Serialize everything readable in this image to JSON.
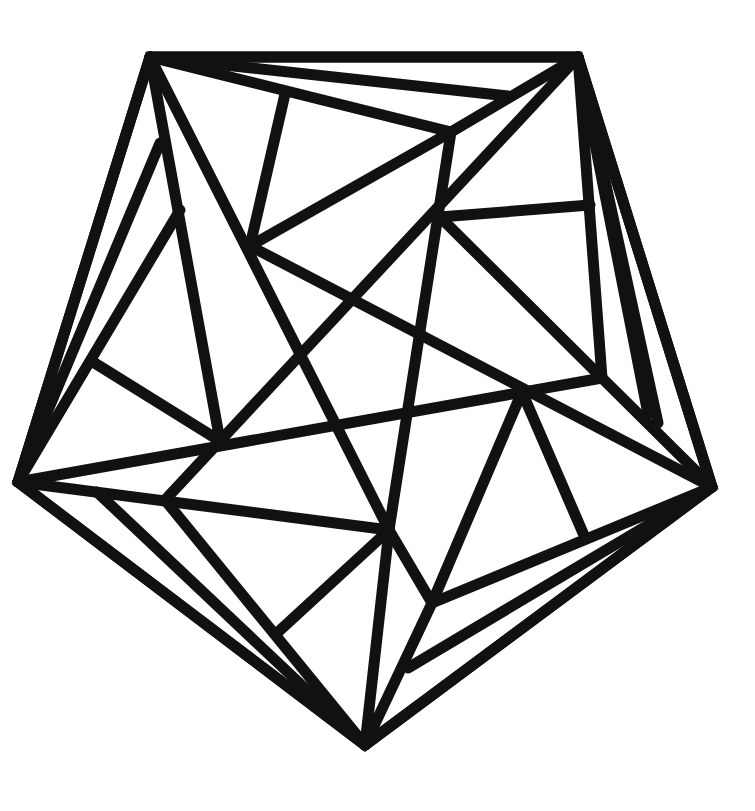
{
  "diagram": {
    "type": "geometric-line-art",
    "colors": {
      "background": "#ffffff",
      "stroke": "#111111"
    },
    "stroke_width": 11,
    "outline": {
      "shape": "pentagon",
      "vertices": [
        [
          150,
          57
        ],
        [
          578,
          57
        ],
        [
          712,
          487
        ],
        [
          365,
          745
        ],
        [
          18,
          482
        ]
      ]
    },
    "points": {
      "TL": [
        150,
        57
      ],
      "TR": [
        578,
        57
      ],
      "R": [
        712,
        487
      ],
      "BOT": [
        365,
        745
      ],
      "L": [
        18,
        482
      ],
      "A": [
        180,
        210
      ],
      "B": [
        250,
        246
      ],
      "C": [
        285,
        94
      ],
      "D": [
        451,
        132
      ],
      "E": [
        440,
        217
      ],
      "F": [
        93,
        362
      ],
      "G": [
        220,
        441
      ],
      "H": [
        165,
        500
      ],
      "I": [
        97,
        492
      ],
      "J": [
        389,
        530
      ],
      "K": [
        277,
        633
      ],
      "LP": [
        432,
        603
      ],
      "M": [
        522,
        392
      ],
      "N": [
        583,
        533
      ],
      "P": [
        408,
        668
      ],
      "Q": [
        602,
        378
      ],
      "S": [
        160,
        143
      ],
      "U": [
        508,
        96
      ],
      "V": [
        590,
        205
      ],
      "W1": [
        648,
        414
      ],
      "W2": [
        658,
        423
      ]
    },
    "segments": [
      [
        "TL",
        "TR"
      ],
      [
        "TR",
        "R"
      ],
      [
        "R",
        "BOT"
      ],
      [
        "BOT",
        "L"
      ],
      [
        "L",
        "TL"
      ],
      [
        "TL",
        "D"
      ],
      [
        "TL",
        "U"
      ],
      [
        "TR",
        "D"
      ],
      [
        "D",
        "B"
      ],
      [
        "C",
        "B"
      ],
      [
        "TL",
        "J"
      ],
      [
        "TL",
        "G"
      ],
      [
        "S",
        "L"
      ],
      [
        "A",
        "L"
      ],
      [
        "F",
        "G"
      ],
      [
        "TR",
        "G"
      ],
      [
        "D",
        "J"
      ],
      [
        "E",
        "V"
      ],
      [
        "TR",
        "Q"
      ],
      [
        "E",
        "Q"
      ],
      [
        "Q",
        "R"
      ],
      [
        "TR",
        "W1"
      ],
      [
        "TR",
        "W2"
      ],
      [
        "B",
        "R"
      ],
      [
        "L",
        "Q"
      ],
      [
        "L",
        "J"
      ],
      [
        "G",
        "H"
      ],
      [
        "I",
        "BOT"
      ],
      [
        "H",
        "BOT"
      ],
      [
        "J",
        "K"
      ],
      [
        "J",
        "BOT"
      ],
      [
        "J",
        "LP"
      ],
      [
        "M",
        "LP"
      ],
      [
        "M",
        "N"
      ],
      [
        "LP",
        "R"
      ],
      [
        "LP",
        "BOT"
      ],
      [
        "P",
        "R"
      ]
    ]
  }
}
